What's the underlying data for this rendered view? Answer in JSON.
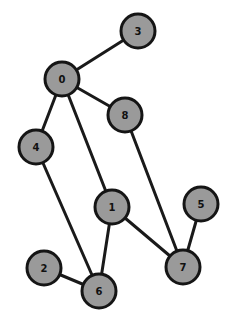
{
  "graph": {
    "node_radius": 17,
    "colors": {
      "node_fill": "#9a9a9a",
      "node_stroke": "#151515",
      "edge": "#1a1a1a",
      "background": "#ffffff"
    },
    "nodes": [
      {
        "id": "0",
        "label": "0",
        "x": 62,
        "y": 79
      },
      {
        "id": "1",
        "label": "1",
        "x": 112,
        "y": 207
      },
      {
        "id": "2",
        "label": "2",
        "x": 44,
        "y": 268
      },
      {
        "id": "3",
        "label": "3",
        "x": 138,
        "y": 31
      },
      {
        "id": "4",
        "label": "4",
        "x": 36,
        "y": 147
      },
      {
        "id": "5",
        "label": "5",
        "x": 201,
        "y": 204
      },
      {
        "id": "6",
        "label": "6",
        "x": 99,
        "y": 291
      },
      {
        "id": "7",
        "label": "7",
        "x": 183,
        "y": 267
      },
      {
        "id": "8",
        "label": "8",
        "x": 125,
        "y": 115
      }
    ],
    "edges": [
      [
        "0",
        "3"
      ],
      [
        "0",
        "8"
      ],
      [
        "0",
        "4"
      ],
      [
        "0",
        "1"
      ],
      [
        "8",
        "7"
      ],
      [
        "4",
        "6"
      ],
      [
        "1",
        "6"
      ],
      [
        "1",
        "7"
      ],
      [
        "5",
        "7"
      ],
      [
        "2",
        "6"
      ]
    ]
  }
}
